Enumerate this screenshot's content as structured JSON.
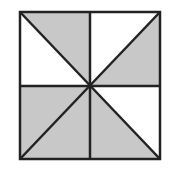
{
  "diagram": {
    "colors": {
      "shaded": "#c8c8c8",
      "unshaded": "#ffffff",
      "stroke": "#222222"
    },
    "square": {
      "x1": 20,
      "y1": 12,
      "x2": 160,
      "y2": 159,
      "cx": 90,
      "cy": 86
    },
    "triangles": [
      {
        "id": "tl-top",
        "shaded": true
      },
      {
        "id": "tl-left",
        "shaded": false
      },
      {
        "id": "tr-top",
        "shaded": false
      },
      {
        "id": "tr-right",
        "shaded": true
      },
      {
        "id": "bl-left",
        "shaded": true
      },
      {
        "id": "bl-bottom",
        "shaded": true
      },
      {
        "id": "br-right",
        "shaded": false
      },
      {
        "id": "br-bottom",
        "shaded": true
      }
    ]
  }
}
